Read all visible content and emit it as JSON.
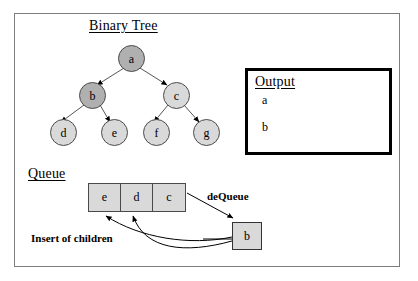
{
  "diagram": {
    "title_binary_tree": "Binary Tree",
    "title_queue": "Queue",
    "title_output": "Output"
  },
  "tree": {
    "nodes": [
      {
        "id": "a",
        "label": "a",
        "shade": "dark",
        "x": 118,
        "y": 45
      },
      {
        "id": "b",
        "label": "b",
        "shade": "dark",
        "x": 79,
        "y": 82
      },
      {
        "id": "c",
        "label": "c",
        "shade": "light",
        "x": 163,
        "y": 82
      },
      {
        "id": "d",
        "label": "d",
        "shade": "light",
        "x": 50,
        "y": 119
      },
      {
        "id": "e",
        "label": "e",
        "shade": "light",
        "x": 101,
        "y": 119
      },
      {
        "id": "f",
        "label": "f",
        "shade": "light",
        "x": 143,
        "y": 119
      },
      {
        "id": "g",
        "label": "g",
        "shade": "light",
        "x": 193,
        "y": 119
      }
    ],
    "edges": [
      {
        "from": "a",
        "to": "b"
      },
      {
        "from": "a",
        "to": "c"
      },
      {
        "from": "b",
        "to": "d"
      },
      {
        "from": "b",
        "to": "e"
      },
      {
        "from": "c",
        "to": "f"
      },
      {
        "from": "c",
        "to": "g"
      }
    ]
  },
  "output": {
    "items": [
      "a",
      "b"
    ]
  },
  "queue": {
    "cells": [
      "e",
      "d",
      "c"
    ]
  },
  "dequeued": {
    "label": "b"
  },
  "annotations": {
    "dequeue": "deQueue",
    "insert_of_children": "Insert of children"
  },
  "colors": {
    "node_dark": "#b0b0b0",
    "node_light": "#d9d9d9",
    "box_fill": "#d9d9d9",
    "stroke": "#000000",
    "frame": "#7d7d7d"
  }
}
